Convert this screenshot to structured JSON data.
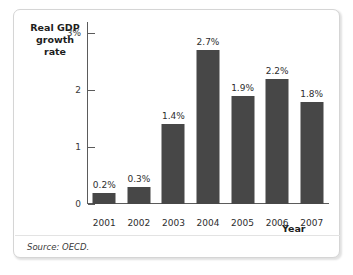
{
  "figure": {
    "axis_title_y": "Real GDP\ngrowth rate",
    "axis_title_y_line1": "Real GDP",
    "axis_title_y_line2": "growth rate",
    "axis_title_x": "Year",
    "source_note": "Source: OECD.",
    "bar_color": "#474747",
    "axis_color": "#5b5b5b",
    "frame_color": "#d5d5d5",
    "background_color": "#ffffff"
  },
  "chart_data": {
    "type": "bar",
    "title": "",
    "subtitle": "",
    "xlabel": "Year",
    "ylabel": "Real GDP growth rate",
    "categories": [
      "2001",
      "2002",
      "2003",
      "2004",
      "2005",
      "2006",
      "2007"
    ],
    "values": [
      0.2,
      0.3,
      1.4,
      2.7,
      1.9,
      2.2,
      1.8
    ],
    "data_labels": [
      "0.2%",
      "0.3%",
      "1.4%",
      "2.7%",
      "1.9%",
      "2.2%",
      "1.8%"
    ],
    "ylim": [
      0,
      3.2
    ],
    "yticks": [
      0,
      1,
      2,
      3
    ],
    "ytick_labels": [
      "0",
      "1",
      "2",
      "3%"
    ],
    "grid": false,
    "legend": null,
    "source": "OECD"
  }
}
